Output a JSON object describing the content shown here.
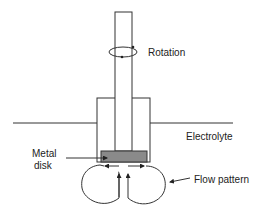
{
  "diagram": {
    "labels": {
      "rotation": "Rotation",
      "electrolyte": "Electrolyte",
      "metal_disk_line1": "Metal",
      "metal_disk_line2": "disk",
      "flow_pattern": "Flow pattern"
    },
    "colors": {
      "line": "#333333",
      "disk_fill": "#8a8a8a",
      "background": "#ffffff"
    }
  }
}
